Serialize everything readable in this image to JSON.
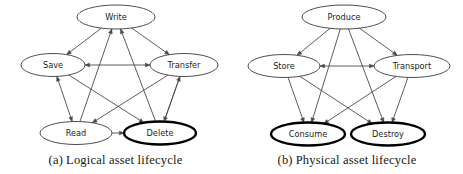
{
  "figures": [
    {
      "id": "logical-asset-lifecycle",
      "caption_label": "(a)",
      "caption_text": "Logical asset lifecycle",
      "nodes": [
        {
          "id": "write",
          "label": "Write",
          "cx": 116,
          "cy": 17,
          "rx": 39,
          "ry": 12,
          "emphasis": false
        },
        {
          "id": "save",
          "label": "Save",
          "cx": 53,
          "cy": 65,
          "rx": 32,
          "ry": 11.5,
          "emphasis": false
        },
        {
          "id": "transfer",
          "label": "Transfer",
          "cx": 184,
          "cy": 65,
          "rx": 34,
          "ry": 11.5,
          "emphasis": false
        },
        {
          "id": "read",
          "label": "Read",
          "cx": 76,
          "cy": 133,
          "rx": 36,
          "ry": 11.5,
          "emphasis": false
        },
        {
          "id": "delete",
          "label": "Delete",
          "cx": 160,
          "cy": 133,
          "rx": 36,
          "ry": 11.5,
          "emphasis": true
        }
      ],
      "edges": [
        {
          "from": "write",
          "to": "save",
          "direction": "one-way"
        },
        {
          "from": "write",
          "to": "transfer",
          "direction": "one-way"
        },
        {
          "from": "save",
          "to": "transfer",
          "direction": "two-way"
        },
        {
          "from": "save",
          "to": "read",
          "direction": "two-way"
        },
        {
          "from": "save",
          "to": "delete",
          "direction": "one-way"
        },
        {
          "from": "transfer",
          "to": "read",
          "direction": "one-way"
        },
        {
          "from": "transfer",
          "to": "delete",
          "direction": "one-way"
        },
        {
          "from": "read",
          "to": "write",
          "direction": "one-way"
        },
        {
          "from": "read",
          "to": "delete",
          "direction": "one-way"
        },
        {
          "from": "delete",
          "to": "write",
          "direction": "one-way"
        },
        {
          "from": "delete",
          "to": "transfer",
          "direction": "one-way"
        }
      ]
    },
    {
      "id": "physical-asset-lifecycle",
      "caption_label": "(b)",
      "caption_text": "Physical asset lifecycle",
      "nodes": [
        {
          "id": "produce",
          "label": "Produce",
          "cx": 113,
          "cy": 17,
          "rx": 42,
          "ry": 12,
          "emphasis": false
        },
        {
          "id": "store",
          "label": "Store",
          "cx": 53,
          "cy": 66,
          "rx": 36,
          "ry": 11.5,
          "emphasis": false
        },
        {
          "id": "transport",
          "label": "Transport",
          "cx": 181,
          "cy": 66,
          "rx": 38,
          "ry": 11.5,
          "emphasis": false
        },
        {
          "id": "consume",
          "label": "Consume",
          "cx": 77,
          "cy": 134,
          "rx": 37,
          "ry": 11.5,
          "emphasis": true
        },
        {
          "id": "destroy",
          "label": "Destroy",
          "cx": 157,
          "cy": 134,
          "rx": 37,
          "ry": 11.5,
          "emphasis": true
        }
      ],
      "edges": [
        {
          "from": "produce",
          "to": "store",
          "direction": "one-way"
        },
        {
          "from": "produce",
          "to": "transport",
          "direction": "one-way"
        },
        {
          "from": "produce",
          "to": "consume",
          "direction": "one-way"
        },
        {
          "from": "produce",
          "to": "destroy",
          "direction": "one-way"
        },
        {
          "from": "store",
          "to": "transport",
          "direction": "two-way"
        },
        {
          "from": "store",
          "to": "consume",
          "direction": "one-way"
        },
        {
          "from": "store",
          "to": "destroy",
          "direction": "one-way"
        },
        {
          "from": "transport",
          "to": "consume",
          "direction": "one-way"
        },
        {
          "from": "transport",
          "to": "destroy",
          "direction": "one-way"
        }
      ]
    }
  ],
  "style": {
    "node_stroke": "#3a3a3a",
    "node_emphasis_stroke": "#000000",
    "edge_stroke": "#4a4a4a",
    "node_fill": "#ffffff",
    "background": "#ffffff",
    "text_color": "#1d1d1d"
  }
}
